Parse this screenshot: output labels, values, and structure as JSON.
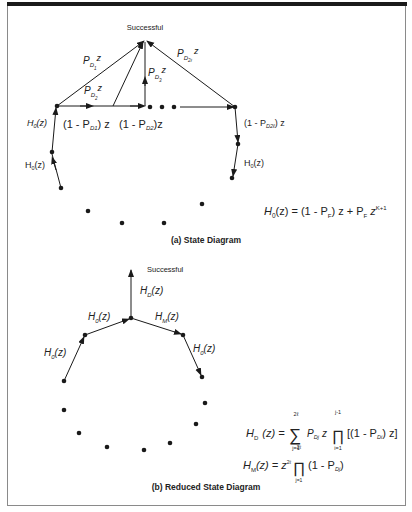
{
  "diagram_a": {
    "top_label": "Successful",
    "caption": "(a)  State Diagram",
    "edge_labels": {
      "pd1": {
        "base": "P",
        "sub": "D",
        "subsub": "1",
        "tail": "z"
      },
      "pd2": {
        "base": "P",
        "sub": "D",
        "subsub": "2",
        "tail": "z"
      },
      "pd3": {
        "base": "P",
        "sub": "D",
        "subsub": "3",
        "tail": "z"
      },
      "pd2l": {
        "base": "P",
        "sub": "D",
        "subsub": "2ℓ",
        "tail": "z"
      },
      "miss1": "(1 - P",
      "miss1_sub": "D1",
      "miss1_tail": ") z",
      "miss2": "(1 - P",
      "miss2_sub": "D2",
      "miss2_tail": ")z",
      "miss2l": "(1 - P",
      "miss2l_sub": "D2ℓ",
      "miss2l_tail": ") z",
      "h0_left_1": "H",
      "h0_left_1_sub": "0",
      "h0_left_1_tail": "(z)",
      "h0_left_2": "H",
      "h0_left_2_sub": "0",
      "h0_left_2_tail": "(z)",
      "h0_right": "H",
      "h0_right_sub": "0",
      "h0_right_tail": "(z)"
    },
    "equation": {
      "lhs": "H",
      "lhs_sub": "0",
      "body": "(z) = (1 - P",
      "pf_sub": "F",
      "mid": ") z + P",
      "pf2_sub": "F",
      "z": " z",
      "exp": "K+1"
    }
  },
  "diagram_b": {
    "top_label": "Successful",
    "caption": "(b)  Reduced State Diagram",
    "edge_labels": {
      "hd": {
        "base": "H",
        "sub": "D",
        "tail": "(z)"
      },
      "h0_mid": {
        "base": "H",
        "sub": "0",
        "tail": "(z)"
      },
      "hm": {
        "base": "H",
        "sub": "M",
        "tail": "(z)"
      },
      "h0_left": {
        "base": "H",
        "sub": "0",
        "tail": "(z)"
      },
      "h0_right": {
        "base": "H",
        "sub": "0",
        "tail": "(z)"
      }
    },
    "equation_hd": {
      "lhs": "H",
      "lhs_sub": "D",
      "lhs_tail": "(z) =",
      "sum_top": "2ℓ",
      "sum_bottom": "j=1",
      "term": "P",
      "term_sub": "Dj",
      "z": "z",
      "prod_top": "j-1",
      "prod_bottom": "i=1",
      "bracket": "[(1 - P",
      "bracket_sub": "Di",
      "bracket_tail": ") z]"
    },
    "equation_hm": {
      "lhs": "H",
      "lhs_sub": "M",
      "lhs_tail": "(z) = z",
      "exp": "2ℓ",
      "prod_top": "2ℓ",
      "prod_bottom": "j=1",
      "tail": "(1 - P",
      "tail_sub": "Dj",
      "close": ")"
    }
  },
  "colors": {
    "ink": "#1a1a1a",
    "frame": "#8a8a8a",
    "bar": "#1a1a1a"
  }
}
